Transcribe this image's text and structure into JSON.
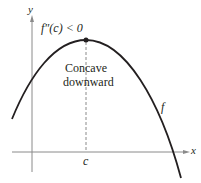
{
  "diagram": {
    "condition_label": "f″(c) < 0",
    "annotation_line1": "Concave",
    "annotation_line2": "downward",
    "function_label": "f",
    "x_axis_label": "x",
    "y_axis_label": "y",
    "point_label": "c",
    "colors": {
      "curve": "#231f20",
      "axis": "#8a8a8a",
      "dashed": "#8a8a8a",
      "text": "#231f20"
    },
    "peak": {
      "x": 86,
      "y": 40
    }
  }
}
